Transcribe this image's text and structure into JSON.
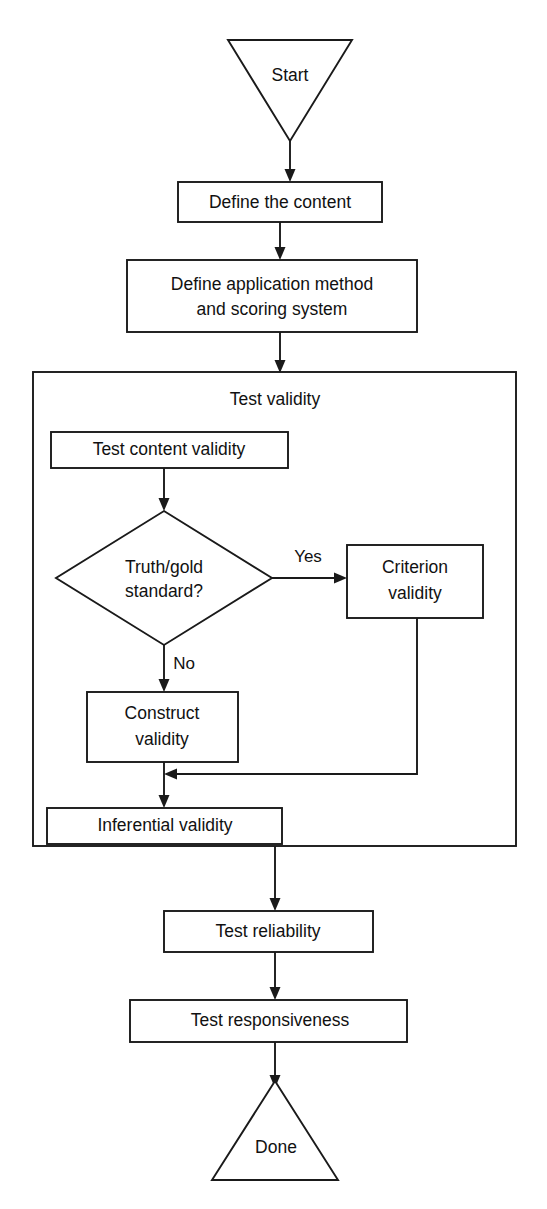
{
  "diagram": {
    "type": "flowchart",
    "orientation": "top-to-bottom",
    "background_color": "#ffffff",
    "line_color": "#1a1a1a",
    "text_color": "#111111",
    "nodes": [
      {
        "id": "start",
        "shape": "triangle-down",
        "label": "Start"
      },
      {
        "id": "define_content",
        "shape": "rectangle",
        "label": "Define the content"
      },
      {
        "id": "define_method_l1",
        "shape": "rectangle",
        "label": "Define application method"
      },
      {
        "id": "define_method_l2",
        "shape": "rectangle",
        "label": "and scoring system"
      },
      {
        "id": "test_validity",
        "shape": "container",
        "label": "Test validity"
      },
      {
        "id": "test_content",
        "shape": "rectangle",
        "label": "Test content validity"
      },
      {
        "id": "decision_l1",
        "shape": "diamond",
        "label": "Truth/gold"
      },
      {
        "id": "decision_l2",
        "shape": "diamond",
        "label": "standard?"
      },
      {
        "id": "criterion_l1",
        "shape": "rectangle",
        "label": "Criterion"
      },
      {
        "id": "criterion_l2",
        "shape": "rectangle",
        "label": "validity"
      },
      {
        "id": "construct_l1",
        "shape": "rectangle",
        "label": "Construct"
      },
      {
        "id": "construct_l2",
        "shape": "rectangle",
        "label": "validity"
      },
      {
        "id": "inferential",
        "shape": "rectangle",
        "label": "Inferential validity"
      },
      {
        "id": "test_reliability",
        "shape": "rectangle",
        "label": "Test reliability"
      },
      {
        "id": "test_responsive",
        "shape": "rectangle",
        "label": "Test responsiveness"
      },
      {
        "id": "done",
        "shape": "triangle-up",
        "label": "Done"
      }
    ],
    "edge_labels": {
      "yes": "Yes",
      "no": "No"
    }
  }
}
